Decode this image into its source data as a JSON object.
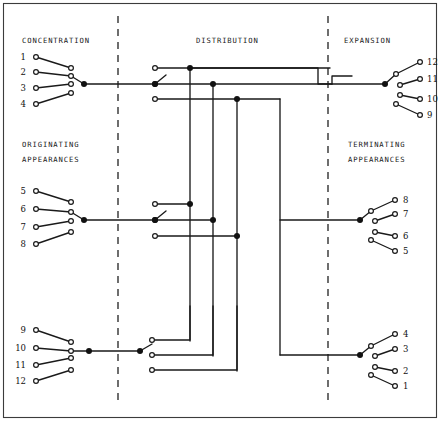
{
  "diagram": {
    "width": 440,
    "height": 421,
    "stroke_color": "#1a1a1a",
    "background_color": "#ffffff",
    "border_color": "#3b3b3b",
    "dashed_color": "#4a4a4a"
  },
  "section_labels": {
    "concentration": "CONCENTRATION",
    "distribution": "DISTRIBUTION",
    "expansion": "EXPANSION",
    "originating": "ORIGINATING",
    "originating_2": "APPEARANCES",
    "terminating": "TERMINATING",
    "terminating_2": "APPEARANCES"
  },
  "left_terminals": {
    "group_top": [
      "1",
      "2",
      "3",
      "4"
    ],
    "group_middle": [
      "5",
      "6",
      "7",
      "8"
    ],
    "group_bottom": [
      "9",
      "10",
      "11",
      "12"
    ]
  },
  "right_terminals": {
    "group_top": [
      "12",
      "11",
      "10",
      "9"
    ],
    "group_middle": [
      "8",
      "7",
      "6",
      "5"
    ],
    "group_bottom": [
      "4",
      "3",
      "2",
      "1"
    ]
  },
  "divider_lines": {
    "left_x": 118,
    "right_x": 328,
    "style": "dashed"
  },
  "trunks": {
    "vertical_x": [
      190,
      213,
      237,
      280
    ],
    "count": 4
  }
}
